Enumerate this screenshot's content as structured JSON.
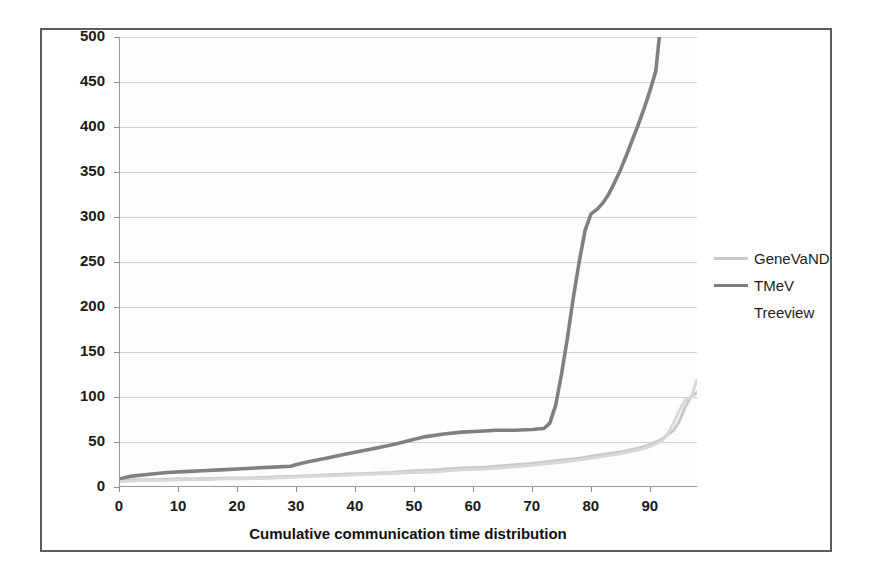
{
  "figure": {
    "background": "#ffffff",
    "frame_color": "#5c5c5c",
    "axis_color": "#9a9a9a",
    "grid_color": "#d2d2d2"
  },
  "chart_data": {
    "type": "line",
    "title": "",
    "xlabel": "Cumulative communication time distribution",
    "ylabel": "Communication time (ms)",
    "xlim": [
      0,
      98
    ],
    "ylim": [
      0,
      500
    ],
    "ytick_step": 50,
    "xtick_step": 10,
    "grid": true,
    "legend_position": "right",
    "xticks": [
      0,
      10,
      20,
      30,
      40,
      50,
      60,
      70,
      80,
      90
    ],
    "yticks": [
      0,
      50,
      100,
      150,
      200,
      250,
      300,
      350,
      400,
      450,
      500
    ],
    "series": [
      {
        "name": "GeneVaND",
        "color": "#c9c9c9",
        "width": 3,
        "x": [
          0,
          3,
          6,
          10,
          14,
          18,
          22,
          26,
          30,
          34,
          38,
          42,
          46,
          50,
          54,
          58,
          62,
          66,
          70,
          74,
          78,
          82,
          85,
          88,
          90,
          92,
          94,
          95,
          96,
          97,
          98
        ],
        "y": [
          6,
          7,
          7,
          8,
          8,
          9,
          9,
          10,
          11,
          12,
          13,
          14,
          15,
          17,
          18,
          20,
          21,
          23,
          25,
          28,
          31,
          35,
          38,
          42,
          46,
          52,
          62,
          72,
          88,
          100,
          104
        ]
      },
      {
        "name": "TMeV",
        "color": "#808080",
        "width": 3.6,
        "x": [
          0,
          2,
          5,
          8,
          11,
          14,
          17,
          20,
          23,
          26,
          29,
          30,
          32,
          35,
          38,
          41,
          44,
          47,
          50,
          52,
          55,
          58,
          61,
          64,
          67,
          70,
          72,
          73,
          74,
          75,
          76,
          77,
          78,
          79,
          80,
          81,
          82,
          83,
          84,
          85,
          86,
          87,
          88,
          89,
          90,
          91,
          91.6
        ],
        "y": [
          8,
          11,
          13,
          15,
          16,
          17,
          18,
          19,
          20,
          21,
          22,
          24,
          27,
          31,
          35,
          39,
          43,
          47,
          52,
          55,
          58,
          60,
          61,
          62,
          62,
          63,
          64,
          70,
          90,
          125,
          165,
          210,
          250,
          285,
          303,
          308,
          315,
          325,
          338,
          352,
          368,
          385,
          402,
          420,
          440,
          462,
          500
        ]
      },
      {
        "name": "Treeview",
        "color": "#d8d8d8",
        "width": 3,
        "x": [
          0,
          3,
          6,
          10,
          14,
          18,
          22,
          26,
          30,
          34,
          38,
          42,
          46,
          50,
          54,
          58,
          62,
          66,
          70,
          74,
          78,
          82,
          85,
          88,
          90,
          92,
          93,
          94,
          95,
          96,
          97,
          98
        ],
        "y": [
          5,
          6,
          6,
          7,
          7,
          8,
          8,
          9,
          10,
          11,
          12,
          13,
          14,
          15,
          16,
          18,
          19,
          21,
          23,
          26,
          29,
          33,
          36,
          40,
          44,
          50,
          58,
          70,
          84,
          96,
          99,
          118
        ]
      }
    ]
  },
  "legend": {
    "items": [
      {
        "label": "GeneVaND",
        "color": "#c9c9c9",
        "show_swatch": true
      },
      {
        "label": "TMeV",
        "color": "#808080",
        "show_swatch": true
      },
      {
        "label": "Treeview",
        "color": "#f4f4f4",
        "show_swatch": false
      }
    ]
  }
}
